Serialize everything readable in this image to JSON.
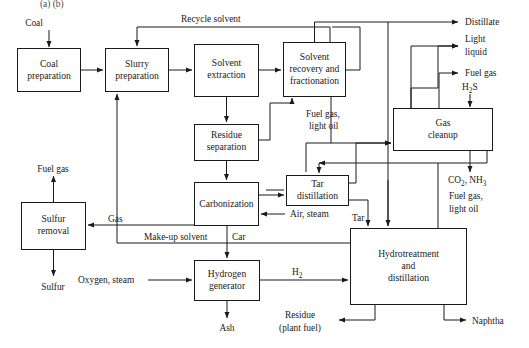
{
  "diagram": {
    "top_cropped_text": "(a)      (b)",
    "colors": {
      "line": "#1a1a1a",
      "box_fill": "#ffffff",
      "background": "#ffffff",
      "text": "#1a1a1a"
    },
    "boxes": [
      {
        "id": "coal_preparation",
        "line1": "Coal",
        "line2": "preparation"
      },
      {
        "id": "slurry_preparation",
        "line1": "Slurry",
        "line2": "preparation"
      },
      {
        "id": "solvent_extraction",
        "line1": "Solvent",
        "line2": "extraction"
      },
      {
        "id": "solvent_recovery",
        "line1": "Solvent",
        "line2": "recovery and",
        "line3": "fractionation"
      },
      {
        "id": "residue_separation",
        "line1": "Residue",
        "line2": "separation"
      },
      {
        "id": "carbonization",
        "line1": "Carbonization"
      },
      {
        "id": "tar_distillation",
        "line1": "Tar",
        "line2": "distillation"
      },
      {
        "id": "gas_cleanup",
        "line1": "Gas",
        "line2": "cleanup"
      },
      {
        "id": "sulfur_removal",
        "line1": "Sulfur",
        "line2": "removal"
      },
      {
        "id": "hydrogen_generator",
        "line1": "Hydrogen",
        "line2": "generator"
      },
      {
        "id": "hydrotreatment",
        "line1": "Hydrotreatment",
        "line2": "and",
        "line3": "distillation"
      }
    ],
    "stream_labels": {
      "coal": "Coal",
      "recycle_solvent": "Recycle solvent",
      "distillate": "Distillate",
      "light_liquid_1": "Light",
      "light_liquid_2": "liquid",
      "fuel_gas_right": "Fuel gas",
      "h2s": "H",
      "h2s_sub": "2",
      "h2s_tail": "S",
      "fuel_gas_light_oil_mid_1": "Fuel gas,",
      "fuel_gas_light_oil_mid_2": "light oil",
      "co2_nh3_a": "CO",
      "co2_nh3_a_sub": "2",
      "co2_nh3_b": ", NH",
      "co2_nh3_b_sub": "3",
      "fuel_gas_light_oil_right_1": "Fuel gas,",
      "fuel_gas_light_oil_right_2": "light oil",
      "fuel_gas_left": "Fuel gas",
      "gas": "Gas",
      "sulfur": "Sulfur",
      "make_up_solvent": "Make-up solvent",
      "air_steam": "Air, steam",
      "tar": "Tar",
      "car": "Car",
      "oxygen_steam": "Oxygen, steam",
      "h2": "H",
      "h2_sub": "2",
      "ash": "Ash",
      "residue_1": "Residue",
      "residue_2": "(plant fuel)",
      "naphtha": "Naphtha"
    }
  }
}
